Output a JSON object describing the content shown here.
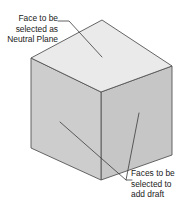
{
  "figure": {
    "name": "draft-feature-cube-diagram",
    "background_color": "#ffffff"
  },
  "shape": {
    "name": "cube",
    "faces": [
      {
        "id": "top",
        "label": "top-face",
        "fill": "#eaeaea",
        "role": "neutral-plane"
      },
      {
        "id": "left",
        "label": "left-front-face",
        "fill": "#cdcdcd",
        "role": "draft-face"
      },
      {
        "id": "right",
        "label": "right-front-face",
        "fill": "#c6c6c6",
        "role": "draft-face"
      }
    ],
    "edge_color": "#555555"
  },
  "callouts": [
    {
      "id": "neutral-plane",
      "lines": [
        "Face to be",
        "selected as",
        "Neutral Plane"
      ],
      "align": "right",
      "target": "top-face"
    },
    {
      "id": "add-draft",
      "lines": [
        "Faces to be",
        "selected to",
        "add draft"
      ],
      "align": "left",
      "target": "left-front-face-and-right-front-face"
    }
  ],
  "leader_color": "#3b3b3b"
}
